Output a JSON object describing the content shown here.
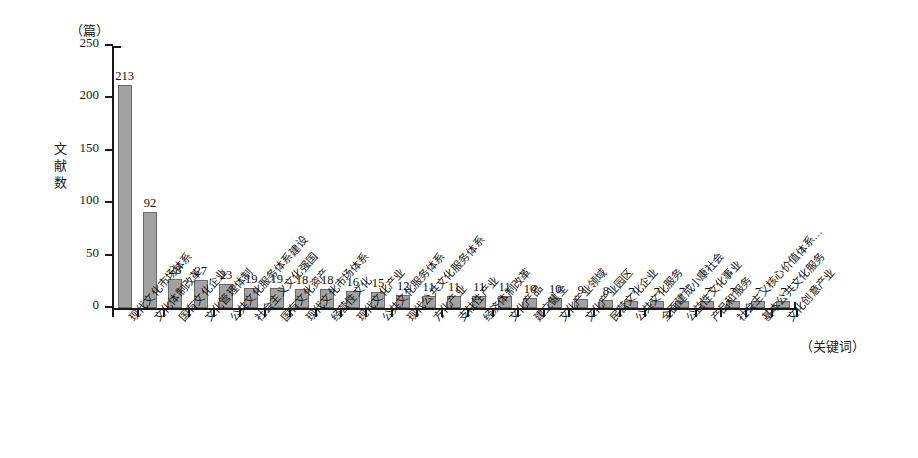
{
  "chart_data": {
    "type": "bar",
    "title": "",
    "subtitle": "",
    "unit_caption": "（篇）",
    "ylabel": "文献数",
    "xlabel": "（关键词）",
    "ylim": [
      0,
      250
    ],
    "yticks": [
      0,
      50,
      100,
      150,
      200,
      250
    ],
    "grid": false,
    "legend": null,
    "orientation": "vertical",
    "bar_color": "#a2a2a2",
    "bar_edge_color": "#6a6a6a",
    "axis_color": "#191919",
    "categories": [
      "现代文化市场体系",
      "文化体制改革",
      "国有文化企业",
      "文化管理体制",
      "公共文化服务体系建设",
      "社会主义文化强国",
      "国有文化资产",
      "现代文化市场体系",
      "经营性文化",
      "现代文化产业",
      "公共文化服务体系",
      "现代公共文化服务体系",
      "方化产业",
      "支柱性产业",
      "经济体制改革",
      "文化产品",
      "建立健全",
      "文化产业领域",
      "文化产业园区",
      "民营文化企业",
      "公共文化服务",
      "全面建成小康社会",
      "公益性文化事业",
      "产品和服务",
      "社会主义核心价值体系…",
      "基本公共文化服务",
      "文化创意产业"
    ],
    "values": [
      213,
      92,
      28,
      27,
      23,
      19,
      19,
      18,
      18,
      16,
      15,
      12,
      11,
      11,
      11,
      11,
      10,
      10,
      9,
      8,
      7,
      7,
      7,
      7,
      7,
      7,
      7
    ]
  }
}
